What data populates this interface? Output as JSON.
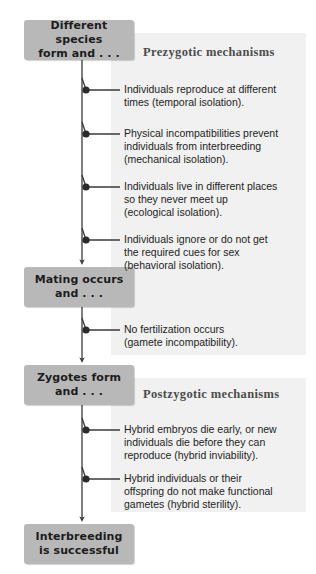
{
  "diagram": {
    "colors": {
      "stage_box_fill": "#b8b8b8",
      "panel_fill": "#f1f1f1",
      "line": "#3a3a3a",
      "text": "#232323",
      "heading_text": "#4c4c4c",
      "page_background": "#ffffff"
    },
    "stages": [
      {
        "id": "different-species",
        "label": "Different species\nform and . . ."
      },
      {
        "id": "mating-occurs",
        "label": "Mating occurs\nand . . ."
      },
      {
        "id": "zygotes-form",
        "label": "Zygotes form\nand . . ."
      },
      {
        "id": "interbreeding",
        "label": "Interbreeding\nis successful"
      }
    ],
    "sections": [
      {
        "id": "prezygotic",
        "heading": "Prezygotic mechanisms"
      },
      {
        "id": "postzygotic",
        "heading": "Postzygotic mechanisms"
      }
    ],
    "branches": [
      {
        "id": "temporal-isolation",
        "section": "prezygotic",
        "text": "Individuals reproduce at different\ntimes (temporal isolation)."
      },
      {
        "id": "mechanical-isolation",
        "section": "prezygotic",
        "text": "Physical incompatibilities prevent\nindividuals from interbreeding\n(mechanical isolation)."
      },
      {
        "id": "ecological-isolation",
        "section": "prezygotic",
        "text": "Individuals live in different places\nso they never meet up\n(ecological isolation)."
      },
      {
        "id": "behavioral-isolation",
        "section": "prezygotic",
        "text": "Individuals ignore or do not get\nthe required cues for sex\n(behavioral isolation)."
      },
      {
        "id": "gamete-incompatibility",
        "section": "prezygotic",
        "text": "No fertilization occurs\n(gamete incompatibility)."
      },
      {
        "id": "hybrid-inviability",
        "section": "postzygotic",
        "text": "Hybrid embryos die early, or new\nindividuals die before they can\nreproduce (hybrid inviability)."
      },
      {
        "id": "hybrid-sterility",
        "section": "postzygotic",
        "text": "Hybrid individuals or their\noffspring do not make functional\ngametes (hybrid sterility)."
      }
    ]
  }
}
